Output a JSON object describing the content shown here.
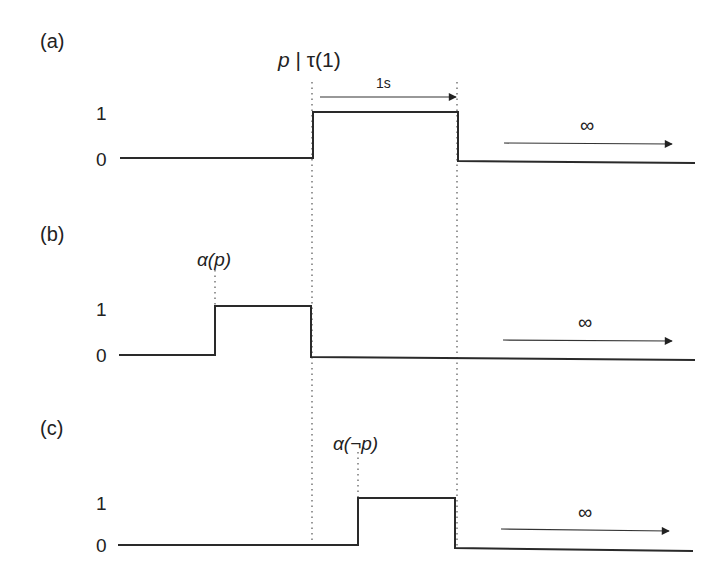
{
  "diagram": {
    "type": "timing-diagram",
    "panels": [
      {
        "id": "a",
        "label": "(a)",
        "high_label": "1",
        "low_label": "0",
        "event_label_prefix": "p",
        "event_label_sep": " | ",
        "event_label_suffix": "τ(1)",
        "duration_label": "1s",
        "infinity_label": "∞",
        "pulse": {
          "rise_x": 314,
          "fall_x": 458
        }
      },
      {
        "id": "b",
        "label": "(b)",
        "high_label": "1",
        "low_label": "0",
        "event_label_alpha": "α",
        "event_label_arg": "(p)",
        "infinity_label": "∞",
        "pulse": {
          "rise_x": 215,
          "fall_x": 311
        }
      },
      {
        "id": "c",
        "label": "(c)",
        "high_label": "1",
        "low_label": "0",
        "event_label_alpha": "α",
        "event_label_arg": "(¬p)",
        "infinity_label": "∞",
        "pulse": {
          "rise_x": 358,
          "fall_x": 455
        }
      }
    ],
    "colors": {
      "stroke": "#2a2a2a",
      "text": "#222222",
      "background": "#ffffff"
    }
  }
}
